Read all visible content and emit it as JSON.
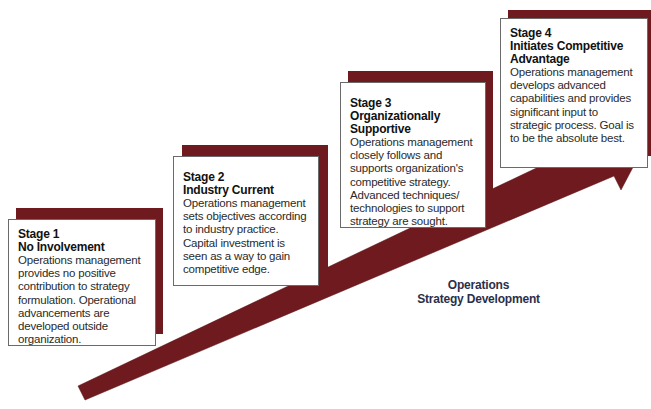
{
  "diagram": {
    "title_cutoff": "... g ... p ... gy",
    "axis_label": {
      "line1": "Operations",
      "line2": "Strategy Development"
    },
    "colors": {
      "accent": "#6e1a1e",
      "box_border": "#6a6a6a",
      "axis_label": "#2b2f4a"
    },
    "stages": [
      {
        "number": "Stage 1",
        "name": "No Involvement",
        "description": "Operations management provides no positive contribution to strategy formulation. Operational advancements are developed outside organization."
      },
      {
        "number": "Stage 2",
        "name": "Industry Current",
        "description": "Operations management sets objectives according to industry practice. Capital investment is seen as a way to gain competitive edge."
      },
      {
        "number": "Stage 3",
        "name": "Organizationally Supportive",
        "description": "Operations management closely follows and supports organization's competitive strategy. Advanced techniques/ technologies to support strategy are sought."
      },
      {
        "number": "Stage 4",
        "name": "Initiates Competitive Advantage",
        "description": "Operations management develops advanced capabilities and provides significant input to strategic process. Goal is to be the absolute best."
      }
    ]
  }
}
